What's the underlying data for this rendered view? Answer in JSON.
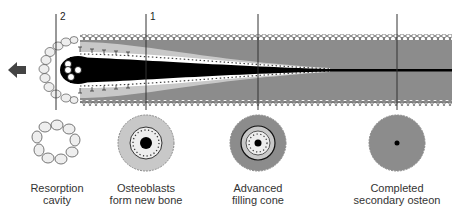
{
  "diagram": {
    "markers": [
      {
        "id": "2",
        "label": "2"
      },
      {
        "id": "1",
        "label": "1"
      }
    ],
    "direction_arrow": "arrow-left-icon",
    "stages": [
      {
        "line1": "Resorption",
        "line2": "cavity"
      },
      {
        "line1": "Osteoblasts",
        "line2": "form new bone"
      },
      {
        "line1": "Advanced",
        "line2": "filling cone"
      },
      {
        "line1": "Completed",
        "line2": "secondary osteon"
      }
    ],
    "colors": {
      "dark_bone": "#8c8c8c",
      "light_bone": "#c8c8c8",
      "canal": "#000000",
      "line": "#333333",
      "cell_fill": "#eeeeee"
    }
  }
}
